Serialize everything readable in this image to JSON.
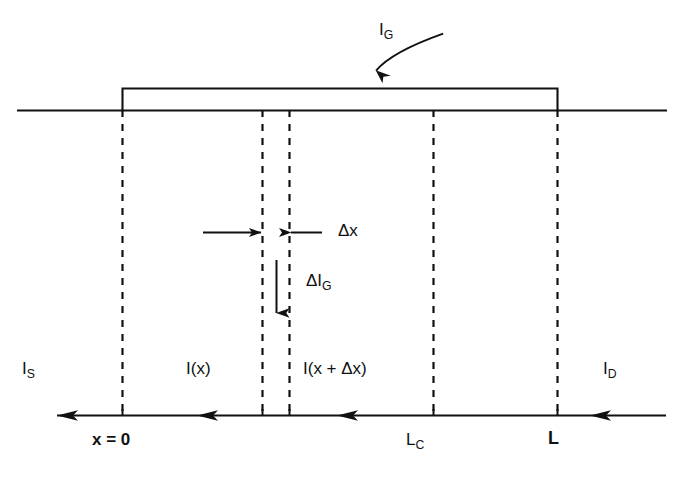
{
  "figure": {
    "type": "technical-line-diagram",
    "background_color": "#ffffff",
    "ink_color": "#111111"
  },
  "labels": {
    "gate_current": {
      "text": "I",
      "sub": "G",
      "x": 379,
      "y": 28
    },
    "delta_x": {
      "text": "Δx",
      "x": 338,
      "y": 228
    },
    "delta_gate_current": {
      "text": "ΔI",
      "sub": "G",
      "x": 306,
      "y": 278
    },
    "source_current": {
      "text": "I",
      "sub": "S",
      "x": 22,
      "y": 366
    },
    "drain_current": {
      "text": "I",
      "sub": "D",
      "x": 603,
      "y": 366
    },
    "current_at_x": {
      "text": "I(x)",
      "x": 186,
      "y": 366
    },
    "current_at_x_plus_dx": {
      "text": "I(x + Δx)",
      "x": 303,
      "y": 366
    },
    "origin": {
      "text": "x = 0",
      "x": 92,
      "y": 437
    },
    "channel_length_c": {
      "text": "L",
      "sub": "C",
      "x": 406,
      "y": 437
    },
    "channel_length": {
      "text": "L",
      "x": 548,
      "y": 435,
      "bold": true
    }
  },
  "geometry": {
    "baseline": {
      "x1": 18,
      "x2": 666,
      "y": 110
    },
    "gate_rect": {
      "x1": 122,
      "x2": 558,
      "y_top": 88,
      "y_bottom": 110
    },
    "current_axis": {
      "x1": 57,
      "x2": 666,
      "y": 415
    },
    "dashed_lines": [
      {
        "name": "x-equals-0",
        "x": 122
      },
      {
        "name": "x",
        "x": 262
      },
      {
        "name": "x-plus-delta-x",
        "x": 289
      },
      {
        "name": "L-sub-c",
        "x": 433
      },
      {
        "name": "L",
        "x": 557
      }
    ],
    "dash_top": 110,
    "dash_bottom": 416,
    "current_arrowheads_x": [
      57,
      197,
      337,
      590
    ],
    "current_arrow_direction": "left",
    "delta_x_arrow_left": {
      "from_x": 203,
      "to_x": 262,
      "y": 232
    },
    "delta_x_arrow_right": {
      "from_x": 322,
      "to_x": 289,
      "y": 232
    },
    "delta_ig_arrow": {
      "x": 276,
      "from_y": 260,
      "to_y": 314
    },
    "gate_callout_arrow": {
      "label_x": 372,
      "label_y": 38,
      "tip_x": 374,
      "tip_y": 86
    }
  }
}
